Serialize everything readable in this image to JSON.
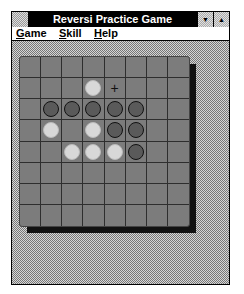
{
  "window": {
    "title": "Reversi Practice Game",
    "system_menu_icon": "system-menu-icon",
    "minimize_icon": "▼",
    "maximize_icon": "▲"
  },
  "menu": [
    {
      "accel": "G",
      "rest": "ame"
    },
    {
      "accel": "S",
      "rest": "kill"
    },
    {
      "accel": "H",
      "rest": "elp"
    }
  ],
  "board": {
    "size": 8,
    "cursor": {
      "row": 1,
      "col": 4,
      "glyph": "+"
    },
    "pieces": [
      {
        "row": 1,
        "col": 3,
        "color": "white"
      },
      {
        "row": 2,
        "col": 1,
        "color": "black"
      },
      {
        "row": 2,
        "col": 2,
        "color": "black"
      },
      {
        "row": 2,
        "col": 3,
        "color": "black"
      },
      {
        "row": 2,
        "col": 4,
        "color": "black"
      },
      {
        "row": 2,
        "col": 5,
        "color": "black"
      },
      {
        "row": 3,
        "col": 1,
        "color": "white"
      },
      {
        "row": 3,
        "col": 3,
        "color": "white"
      },
      {
        "row": 3,
        "col": 4,
        "color": "black"
      },
      {
        "row": 3,
        "col": 5,
        "color": "black"
      },
      {
        "row": 4,
        "col": 2,
        "color": "white"
      },
      {
        "row": 4,
        "col": 3,
        "color": "white"
      },
      {
        "row": 4,
        "col": 4,
        "color": "white"
      },
      {
        "row": 4,
        "col": 5,
        "color": "black"
      }
    ]
  }
}
